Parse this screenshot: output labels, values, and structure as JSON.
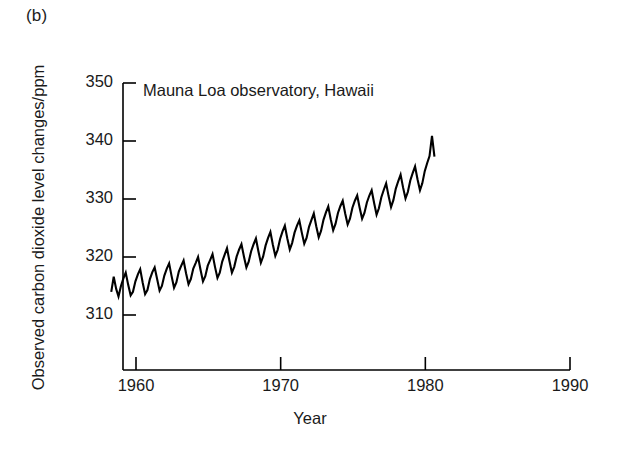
{
  "panel": {
    "label": "(b)"
  },
  "chart_data": {
    "type": "line",
    "title": "",
    "annotation": "Mauna Loa observatory, Hawaii",
    "xlabel": "Year",
    "ylabel": "Observed carbon dioxide level changes/ppm",
    "grid": false,
    "legend": "none",
    "line_color": "#000000",
    "xlim": [
      1957.6,
      1992.0
    ],
    "ylim": [
      303.0,
      353.0
    ],
    "xticks": [
      1960,
      1970,
      1980,
      1990
    ],
    "xtick_labels": [
      "1960",
      "1970",
      "1980",
      "1990"
    ],
    "yticks": [
      310,
      320,
      330,
      340,
      350
    ],
    "ytick_labels": [
      "310",
      "320",
      "330",
      "340",
      "350"
    ],
    "series_name": "Monthly mean CO2 concentration",
    "x": [
      1958.29,
      1958.46,
      1958.63,
      1958.79,
      1958.96,
      1959.13,
      1959.29,
      1959.46,
      1959.63,
      1959.79,
      1959.96,
      1960.13,
      1960.29,
      1960.46,
      1960.63,
      1960.79,
      1960.96,
      1961.13,
      1961.29,
      1961.46,
      1961.63,
      1961.79,
      1961.96,
      1962.13,
      1962.29,
      1962.46,
      1962.63,
      1962.79,
      1962.96,
      1963.13,
      1963.29,
      1963.46,
      1963.63,
      1963.79,
      1963.96,
      1964.13,
      1964.29,
      1964.46,
      1964.63,
      1964.79,
      1964.96,
      1965.13,
      1965.29,
      1965.46,
      1965.63,
      1965.79,
      1965.96,
      1966.13,
      1966.29,
      1966.46,
      1966.63,
      1966.79,
      1966.96,
      1967.13,
      1967.29,
      1967.46,
      1967.63,
      1967.79,
      1967.96,
      1968.13,
      1968.29,
      1968.46,
      1968.63,
      1968.79,
      1968.96,
      1969.13,
      1969.29,
      1969.46,
      1969.63,
      1969.79,
      1969.96,
      1970.13,
      1970.29,
      1970.46,
      1970.63,
      1970.79,
      1970.96,
      1971.13,
      1971.29,
      1971.46,
      1971.63,
      1971.79,
      1971.96,
      1972.13,
      1972.29,
      1972.46,
      1972.63,
      1972.79,
      1972.96,
      1973.13,
      1973.29,
      1973.46,
      1973.63,
      1973.79,
      1973.96,
      1974.13,
      1974.29,
      1974.46,
      1974.63,
      1974.79,
      1974.96,
      1975.13,
      1975.29,
      1975.46,
      1975.63,
      1975.79,
      1975.96,
      1976.13,
      1976.29,
      1976.46,
      1976.63,
      1976.79,
      1976.96,
      1977.13,
      1977.29,
      1977.46,
      1977.63,
      1977.79,
      1977.96,
      1978.13,
      1978.29,
      1978.46,
      1978.63,
      1978.79,
      1978.96,
      1979.13,
      1979.29,
      1979.46,
      1979.63,
      1979.79,
      1979.96,
      1980.13,
      1980.29,
      1980.46,
      1980.63
    ],
    "y": [
      314.0,
      316.6,
      314.5,
      313.2,
      315.0,
      316.3,
      317.3,
      315.2,
      313.4,
      314.0,
      315.8,
      317.0,
      317.9,
      315.6,
      313.6,
      314.3,
      316.2,
      317.4,
      318.2,
      316.2,
      314.2,
      315.0,
      316.8,
      318.0,
      318.9,
      316.7,
      314.7,
      315.6,
      317.5,
      318.5,
      319.4,
      317.2,
      315.3,
      316.2,
      318.0,
      319.0,
      320.0,
      317.8,
      315.8,
      316.7,
      318.5,
      319.5,
      320.5,
      318.3,
      316.4,
      317.3,
      319.2,
      320.4,
      321.5,
      319.3,
      317.3,
      318.3,
      320.1,
      321.3,
      322.2,
      320.1,
      318.2,
      319.2,
      321.0,
      322.2,
      323.2,
      321.0,
      319.0,
      320.1,
      322.0,
      323.3,
      324.3,
      322.1,
      320.2,
      321.2,
      323.1,
      324.4,
      325.4,
      323.2,
      321.3,
      322.4,
      324.2,
      325.4,
      326.3,
      324.2,
      322.3,
      323.3,
      325.2,
      326.4,
      327.5,
      325.3,
      323.4,
      324.5,
      326.4,
      327.7,
      328.7,
      326.5,
      324.6,
      325.7,
      327.6,
      328.8,
      329.7,
      327.5,
      325.6,
      326.6,
      328.5,
      329.7,
      330.6,
      328.5,
      326.6,
      327.6,
      329.4,
      330.6,
      331.5,
      329.3,
      327.3,
      328.4,
      330.3,
      331.6,
      332.7,
      330.5,
      328.6,
      329.8,
      331.8,
      333.1,
      334.2,
      332.0,
      330.1,
      331.2,
      333.2,
      334.5,
      335.6,
      333.4,
      331.5,
      332.7,
      334.8,
      336.2,
      337.4,
      340.9,
      337.3
    ]
  }
}
